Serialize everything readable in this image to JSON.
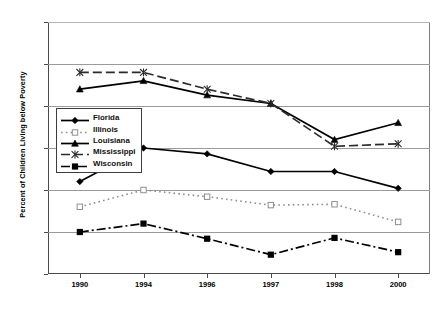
{
  "chart_data": {
    "type": "line",
    "title": "",
    "xlabel": "",
    "ylabel": "Percent of Children Living below Poverty",
    "categories": [
      "1990",
      "1994",
      "1996",
      "1997",
      "1998",
      "2000"
    ],
    "ylim": [
      10,
      40
    ],
    "yticks": [
      10,
      15,
      20,
      25,
      30,
      35,
      40
    ],
    "grid": true,
    "legend_position": "inside-left",
    "series": [
      {
        "name": "Florida",
        "marker": "diamond",
        "linestyle": "solid",
        "color": "#000000",
        "values": [
          21.0,
          25.0,
          24.3,
          22.2,
          22.2,
          20.2
        ]
      },
      {
        "name": "Illinois",
        "marker": "open-square",
        "linestyle": "dotted",
        "color": "#8f8f8f",
        "values": [
          18.0,
          20.0,
          19.2,
          18.2,
          18.3,
          16.2
        ]
      },
      {
        "name": "Louisiana",
        "marker": "triangle",
        "linestyle": "solid",
        "color": "#000000",
        "values": [
          32.0,
          33.0,
          31.3,
          30.3,
          26.0,
          28.0
        ]
      },
      {
        "name": "Mississippi",
        "marker": "asterisk",
        "linestyle": "dashed",
        "color": "#2b2b2b",
        "values": [
          34.0,
          34.0,
          32.0,
          30.3,
          25.2,
          25.5
        ]
      },
      {
        "name": "Wisconsin",
        "marker": "filled-square",
        "linestyle": "dash-dot",
        "color": "#000000",
        "values": [
          15.0,
          16.0,
          14.2,
          12.3,
          14.3,
          12.6
        ]
      }
    ]
  },
  "axis": {
    "y_title": "Percent of Children Living below Poverty",
    "y_tick_labels": [
      "40",
      "35",
      "30",
      "25",
      "20",
      "15",
      "10"
    ],
    "x_tick_labels": [
      "1990",
      "1994",
      "1996",
      "1997",
      "1998",
      "2000"
    ]
  },
  "legend": {
    "entries": [
      {
        "label": "Florida"
      },
      {
        "label": "Illinois"
      },
      {
        "label": "Louisiana"
      },
      {
        "label": "Mississippi"
      },
      {
        "label": "Wisconsin"
      }
    ]
  }
}
